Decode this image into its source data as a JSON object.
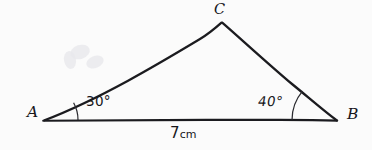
{
  "figure": {
    "background_color": "#fbfbfb",
    "ink_color": "#1b1b1f",
    "vertices": {
      "a": {
        "label": "A",
        "x": 43,
        "y": 120
      },
      "b": {
        "label": "B",
        "x": 337,
        "y": 120
      },
      "c": {
        "label": "C",
        "x": 222,
        "y": 22
      }
    },
    "angles": {
      "at_a": {
        "label": "30°",
        "value": 30,
        "unit": "degrees",
        "arc_radius": 35
      },
      "at_b": {
        "label": "40°",
        "value": 40,
        "unit": "degrees",
        "arc_radius": 45
      }
    },
    "base": {
      "length_value": "7",
      "length_unit": "cm",
      "from": "A",
      "to": "B"
    },
    "sides": [
      {
        "name": "base-ab",
        "from": "A",
        "to": "B"
      },
      {
        "name": "side-ac",
        "from": "A",
        "to": "C"
      },
      {
        "name": "side-cb",
        "from": "C",
        "to": "B"
      }
    ]
  }
}
